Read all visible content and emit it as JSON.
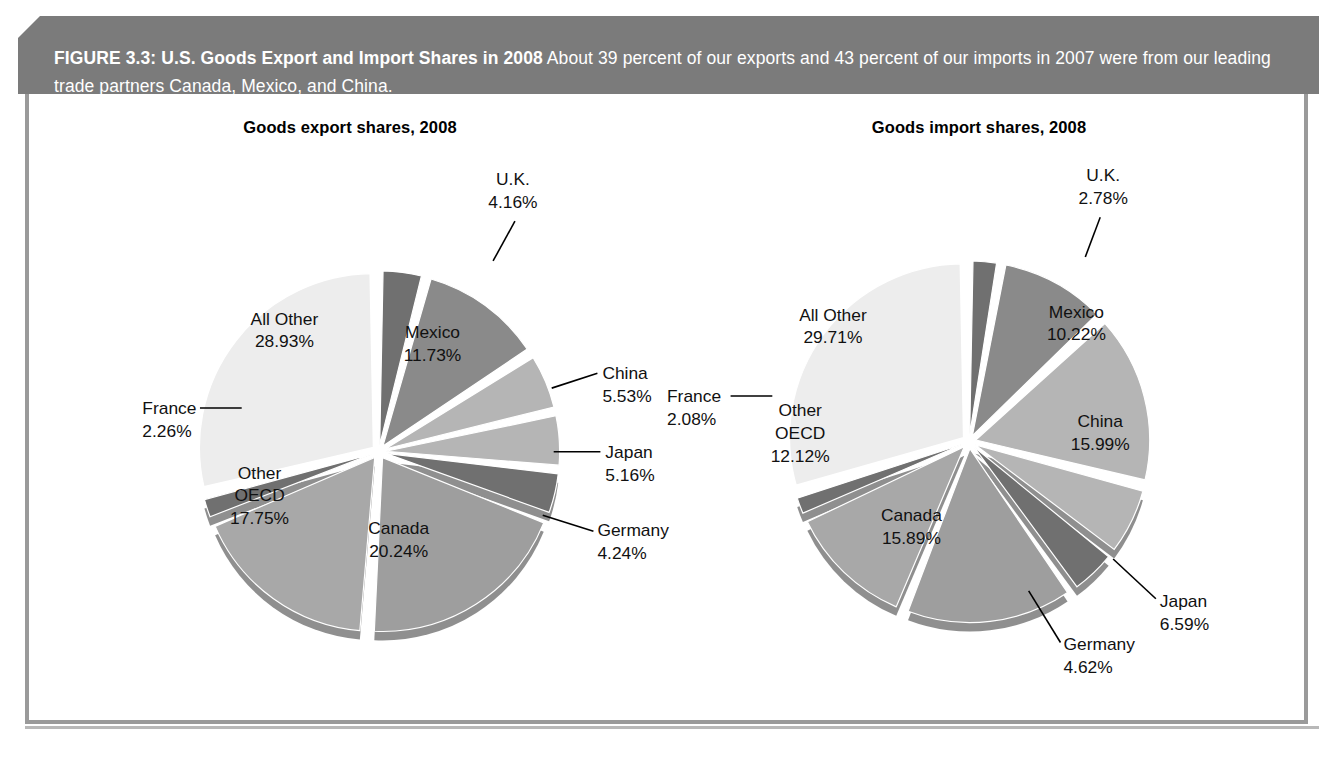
{
  "banner": {
    "figure_label": "FIGURE 3.3: U.S. Goods Export and Import Shares in 2008",
    "caption": "About 39 percent of our exports and 43 percent of our imports in 2007 were from our leading trade partners Canada, Mexico, and China."
  },
  "chart_data": [
    {
      "type": "pie",
      "title": "Goods export shares, 2008",
      "categories": [
        "U.K.",
        "Mexico",
        "China",
        "Japan",
        "Germany",
        "Canada",
        "Other OECD",
        "France",
        "All Other"
      ],
      "values": [
        4.16,
        11.73,
        5.53,
        5.16,
        4.24,
        20.24,
        17.75,
        2.26,
        28.93
      ],
      "value_labels": [
        "4.16%",
        "11.73%",
        "5.53%",
        "5.16%",
        "4.24%",
        "20.24%",
        "17.75%",
        "2.26%",
        "28.93%"
      ],
      "colors": [
        "#707070",
        "#8a8a8a",
        "#b5b5b5",
        "#b5b5b5",
        "#707070",
        "#9e9e9e",
        "#a8a8a8",
        "#707070",
        "#ededed"
      ],
      "label_placement": [
        "outside",
        "inside",
        "outside",
        "outside",
        "outside",
        "inside",
        "inside",
        "outside",
        "inside"
      ],
      "legend": "none",
      "grid": false
    },
    {
      "type": "pie",
      "title": "Goods import shares, 2008",
      "categories": [
        "U.K.",
        "Mexico",
        "China",
        "Japan",
        "Germany",
        "Canada",
        "Other OECD",
        "France",
        "All Other"
      ],
      "values": [
        2.78,
        10.22,
        15.99,
        6.59,
        4.62,
        15.89,
        12.12,
        2.08,
        29.71
      ],
      "value_labels": [
        "2.78%",
        "10.22%",
        "15.99%",
        "6.59%",
        "4.62%",
        "15.89%",
        "12.12%",
        "2.08%",
        "29.71%"
      ],
      "colors": [
        "#707070",
        "#8a8a8a",
        "#b5b5b5",
        "#b5b5b5",
        "#707070",
        "#9e9e9e",
        "#a8a8a8",
        "#707070",
        "#ededed"
      ],
      "label_placement": [
        "outside",
        "inside",
        "inside",
        "outside",
        "outside",
        "inside",
        "inside",
        "outside",
        "inside"
      ],
      "legend": "none",
      "grid": false
    }
  ],
  "export_chart": {
    "title": "Goods export shares, 2008",
    "slices": [
      {
        "name": "U.K.",
        "pct": "4.16%",
        "label_x": 485,
        "label_y": 92,
        "value_x": 485,
        "value_y": 115,
        "anchor": "middle",
        "leader": "M 487,128 L 465,168"
      },
      {
        "name": "Mexico",
        "pct": "11.73%",
        "label_x": 404,
        "label_y": 246,
        "value_x": 404,
        "value_y": 269,
        "anchor": "middle",
        "leader": ""
      },
      {
        "name": "China",
        "pct": "5.53%",
        "label_x": 575,
        "label_y": 287,
        "value_x": 575,
        "value_y": 310,
        "anchor": "start",
        "leader": "M 570,281 L 524,296"
      },
      {
        "name": "Japan",
        "pct": "5.16%",
        "label_x": 578,
        "label_y": 366,
        "value_x": 578,
        "value_y": 389,
        "anchor": "start",
        "leader": "M 573,360 L 526,360"
      },
      {
        "name": "Germany",
        "pct": "4.24%",
        "label_x": 570,
        "label_y": 445,
        "value_x": 570,
        "value_y": 468,
        "anchor": "start",
        "leader": "M 566,440 L 515,424"
      },
      {
        "name": "Canada",
        "pct": "20.24%",
        "label_x": 370,
        "label_y": 443,
        "value_x": 370,
        "value_y": 466,
        "anchor": "middle",
        "leader": ""
      },
      {
        "name": "Other OECD",
        "pct": "17.75%",
        "label_x": 230,
        "label_y": 410,
        "value_x": 230,
        "value_y": 433,
        "anchor": "middle",
        "leader": ""
      },
      {
        "name": "France",
        "pct": "2.26%",
        "label_x": 112,
        "label_y": 322,
        "value_x": 112,
        "value_y": 345,
        "anchor": "start",
        "leader": "M 170,316 L 212,316"
      },
      {
        "name": "All Other",
        "pct": "28.93%",
        "label_x": 255,
        "label_y": 232,
        "value_x": 255,
        "value_y": 255,
        "anchor": "middle",
        "leader": ""
      }
    ],
    "oecd_line1": "Other",
    "oecd_line2": "OECD"
  },
  "import_chart": {
    "title": "Goods import shares, 2008",
    "slices": [
      {
        "name": "U.K.",
        "pct": "2.78%",
        "label_x": 455,
        "label_y": 88,
        "value_x": 455,
        "value_y": 111,
        "anchor": "middle",
        "leader": "M 452,124 L 437,164"
      },
      {
        "name": "Mexico",
        "pct": "10.22%",
        "label_x": 428,
        "label_y": 225,
        "value_x": 428,
        "value_y": 248,
        "anchor": "middle",
        "leader": ""
      },
      {
        "name": "China",
        "pct": "15.99%",
        "label_x": 452,
        "label_y": 335,
        "value_x": 452,
        "value_y": 358,
        "anchor": "middle",
        "leader": ""
      },
      {
        "name": "Japan",
        "pct": "6.59%",
        "label_x": 512,
        "label_y": 516,
        "value_x": 512,
        "value_y": 539,
        "anchor": "start",
        "leader": "M 508,508 L 465,468"
      },
      {
        "name": "Germany",
        "pct": "4.62%",
        "label_x": 415,
        "label_y": 560,
        "value_x": 415,
        "value_y": 583,
        "anchor": "start",
        "leader": "M 412,552 L 380,500"
      },
      {
        "name": "Canada",
        "pct": "15.89%",
        "label_x": 262,
        "label_y": 430,
        "value_x": 262,
        "value_y": 453,
        "anchor": "middle",
        "leader": ""
      },
      {
        "name": "Other OECD",
        "pct": "12.12%",
        "label_x": 150,
        "label_y": 347,
        "value_x": 150,
        "value_y": 370,
        "anchor": "middle",
        "leader": ""
      },
      {
        "name": "France",
        "pct": "2.08%",
        "label_x": 16,
        "label_y": 310,
        "value_x": 16,
        "value_y": 333,
        "anchor": "start",
        "leader": "M 80,304 L 122,304"
      },
      {
        "name": "All Other",
        "pct": "29.71%",
        "label_x": 183,
        "label_y": 228,
        "value_x": 183,
        "value_y": 251,
        "anchor": "middle",
        "leader": ""
      }
    ],
    "oecd_line1": "Other",
    "oecd_line2": "OECD"
  },
  "colors": {
    "banner_bg": "#7b7b7b",
    "banner_text": "#ffffff",
    "panel_border": "#9a9a9a",
    "slice_lightest": "#ededed",
    "slice_light": "#b5b5b5",
    "slice_medium_light": "#a8a8a8",
    "slice_medium": "#9e9e9e",
    "slice_dark": "#8a8a8a",
    "slice_darkest": "#707070",
    "separator": "#ffffff"
  }
}
